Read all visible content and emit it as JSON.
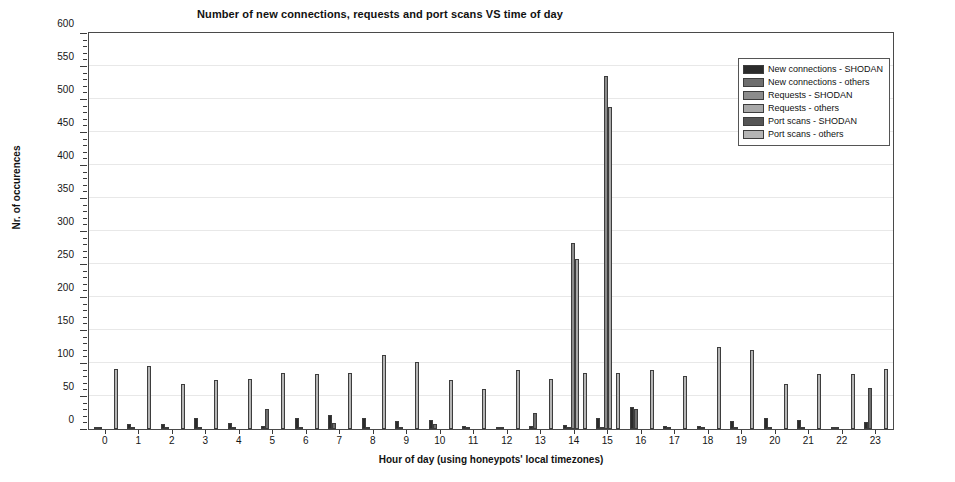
{
  "chart_data": {
    "type": "bar",
    "title": "Number of new connections, requests and port scans VS time of day",
    "xlabel": "Hour of day (using honeypots' local timezones)",
    "ylabel": "Nr. of occurences",
    "ylim": [
      0,
      600
    ],
    "ytick_step": 50,
    "yminor_step": 10,
    "grid": true,
    "legend_position": "upper right",
    "categories": [
      "0",
      "1",
      "2",
      "3",
      "4",
      "5",
      "6",
      "7",
      "8",
      "9",
      "10",
      "11",
      "12",
      "13",
      "14",
      "15",
      "16",
      "17",
      "18",
      "19",
      "20",
      "21",
      "22",
      "23"
    ],
    "yticks": [
      0,
      50,
      100,
      150,
      200,
      250,
      300,
      350,
      400,
      450,
      500,
      550,
      600
    ],
    "series": [
      {
        "name": "New connections - SHODAN",
        "color": "#2b2b2b",
        "values": [
          2,
          7,
          8,
          16,
          9,
          5,
          16,
          21,
          17,
          12,
          13,
          4,
          1,
          4,
          6,
          16,
          33,
          5,
          4,
          12,
          17,
          13,
          1,
          11
        ]
      },
      {
        "name": "New connections - others",
        "color": "#6e6e6e",
        "values": [
          1,
          1,
          1,
          1,
          1,
          30,
          1,
          9,
          3,
          1,
          7,
          1,
          1,
          25,
          3,
          3,
          31,
          2,
          2,
          2,
          2,
          2,
          1,
          62
        ]
      },
      {
        "name": "Requests - SHODAN",
        "color": "#8c8c8c",
        "values": [
          0,
          0,
          0,
          0,
          0,
          0,
          0,
          0,
          0,
          0,
          0,
          0,
          0,
          0,
          282,
          535,
          0,
          0,
          0,
          0,
          0,
          0,
          0,
          0
        ]
      },
      {
        "name": "Requests - others",
        "color": "#a8a8a8",
        "values": [
          0,
          0,
          0,
          0,
          0,
          0,
          0,
          0,
          0,
          0,
          0,
          0,
          0,
          0,
          257,
          488,
          0,
          0,
          0,
          0,
          0,
          0,
          0,
          0
        ]
      },
      {
        "name": "Port scans - SHODAN",
        "color": "#555555",
        "values": [
          0,
          0,
          0,
          0,
          0,
          0,
          0,
          0,
          0,
          0,
          0,
          0,
          0,
          0,
          0,
          0,
          0,
          0,
          0,
          0,
          0,
          0,
          0,
          0
        ]
      },
      {
        "name": "Port scans - others",
        "color": "#b5b5b5",
        "values": [
          91,
          96,
          68,
          74,
          76,
          85,
          83,
          85,
          112,
          101,
          74,
          60,
          89,
          76,
          85,
          85,
          89,
          81,
          125,
          120,
          68,
          83,
          84,
          91
        ]
      }
    ]
  }
}
